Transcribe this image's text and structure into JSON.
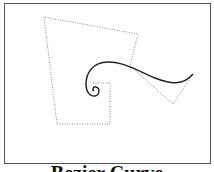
{
  "figure": {
    "caption": "Bezier Curve",
    "colors": {
      "frame": "#555555",
      "curve": "#222222",
      "control_polygon": "#888888",
      "background": "#ffffff"
    },
    "control_polygon": [
      [
        93,
        83
      ],
      [
        110,
        83
      ],
      [
        110,
        124
      ],
      [
        57,
        124
      ],
      [
        44,
        17
      ],
      [
        138,
        34
      ],
      [
        130,
        66
      ],
      [
        173,
        104
      ],
      [
        193,
        74
      ]
    ],
    "curve_path": "M193,74 C183,86 170,84 155,78 C140,72 125,62 108,62 C92,62 86,74 86,84 C86,92 90,97 95,96 C100,95 100,88 96,87 C93,86 92,90 94,91"
  }
}
